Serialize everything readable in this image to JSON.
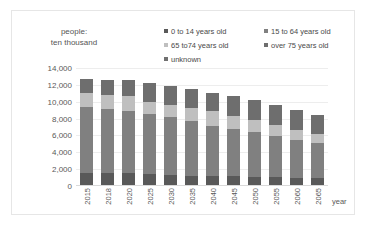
{
  "chart_data": {
    "type": "bar",
    "stacked": true,
    "title": "",
    "subtitle": "",
    "ylabel": "people:\nten thousand",
    "xlabel": "year",
    "grid": true,
    "legend_position": "top-right",
    "ylim": [
      0,
      14000
    ],
    "ytick_labels": [
      "14,000",
      "12,000",
      "10,000",
      "8,000",
      "6,000",
      "4,000",
      "2,000",
      "0"
    ],
    "ytick_values": [
      14000,
      12000,
      10000,
      8000,
      6000,
      4000,
      2000,
      0
    ],
    "categories": [
      "2015",
      "2018",
      "2020",
      "2025",
      "2030",
      "2035",
      "2040",
      "2045",
      "2050",
      "2055",
      "2060",
      "2065"
    ],
    "series": [
      {
        "name": "0 to 14 years old",
        "color": "#595959",
        "values": [
          1595,
          1545,
          1503,
          1407,
          1321,
          1246,
          1194,
          1138,
          1077,
          1012,
          951,
          898
        ]
      },
      {
        "name": "15 to 64 years old",
        "color": "#808080",
        "values": [
          7728,
          7545,
          7406,
          7085,
          6875,
          6494,
          5978,
          5584,
          5275,
          4950,
          4529,
          4189
        ]
      },
      {
        "name": "65 to74 years old",
        "color": "#bfbfbf",
        "values": [
          1734,
          1750,
          1747,
          1497,
          1428,
          1522,
          1681,
          1643,
          1424,
          1258,
          1154,
          1133
        ]
      },
      {
        "name": "over 75  years old",
        "color": "#6e6e6e",
        "values": [
          1632,
          1798,
          1872,
          2180,
          2278,
          2277,
          2239,
          2277,
          2417,
          2446,
          2336,
          2248
        ]
      },
      {
        "name": "unknown",
        "color": "#707070",
        "values": [
          0,
          0,
          0,
          0,
          0,
          0,
          0,
          0,
          0,
          0,
          0,
          0
        ]
      }
    ],
    "totals": [
      12689,
      12638,
      12528,
      12169,
      11902,
      11539,
      11092,
      10642,
      10193,
      9666,
      8970,
      8468
    ]
  },
  "axis": {
    "y_title": "people:\nten thousand",
    "x_title": "year"
  },
  "legend": {
    "rows": [
      [
        {
          "label": "0 to 14 years old",
          "color": "#595959"
        },
        {
          "label": "15 to 64 years old",
          "color": "#808080"
        }
      ],
      [
        {
          "label": "65 to74 years old",
          "color": "#bfbfbf"
        },
        {
          "label": "over 75  years old",
          "color": "#6e6e6e"
        }
      ],
      [
        {
          "label": "unknown",
          "color": "#707070"
        }
      ]
    ]
  }
}
